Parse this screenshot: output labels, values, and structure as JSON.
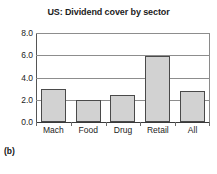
{
  "chart_data": {
    "type": "bar",
    "title": "US: Dividend cover by sector",
    "xlabel": "",
    "ylabel": "",
    "categories": [
      "Mach",
      "Food",
      "Drug",
      "Retail",
      "All"
    ],
    "values": [
      3.0,
      1.95,
      2.45,
      5.9,
      2.8
    ],
    "ylim": [
      0.0,
      8.0
    ],
    "yticks": [
      "0.0",
      "2.0",
      "4.0",
      "6.0",
      "8.0"
    ],
    "ytick_values": [
      0.0,
      2.0,
      4.0,
      6.0,
      8.0
    ],
    "grid": true,
    "legend": false,
    "bar_fill_color": "#d2d2d2",
    "bar_edge_color": "#4a4a4a",
    "axis_color": "#3a3a3a",
    "gridline_color": "#8d8d8d",
    "text_color": "#1c1c1c"
  },
  "figure": {
    "panel_label": "(b)",
    "next_figure_fragment": ""
  }
}
